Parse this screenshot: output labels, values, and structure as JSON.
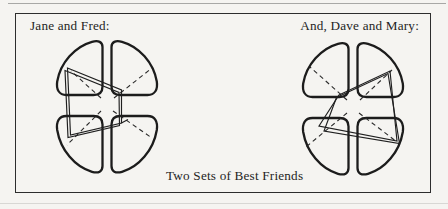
{
  "figure": {
    "caption": "Two Sets of Best Friends",
    "glyphs": [
      {
        "id": "jane-fred",
        "label": "Jane and Fred:"
      },
      {
        "id": "dave-mary",
        "label": "And, Dave and Mary:"
      }
    ]
  },
  "colors": {
    "paper": "#f5f4f1",
    "ink": "#1f1f1f",
    "frame_line": "#2d2d2d",
    "faint_rule": "#a8a8a6"
  }
}
